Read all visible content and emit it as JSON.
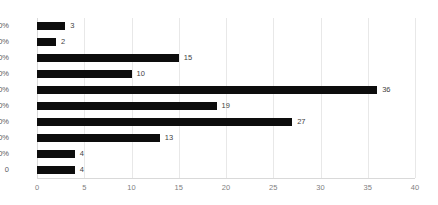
{
  "chart_data": {
    "type": "bar",
    "orientation": "horizontal",
    "title": "",
    "xlabel": "",
    "ylabel": "",
    "categories": [
      "90%",
      "80%",
      "70%",
      "60%",
      "50%",
      "40%",
      "30%",
      "20%",
      "10%",
      "0"
    ],
    "values": [
      3,
      2,
      15,
      10,
      36,
      19,
      27,
      13,
      4,
      4
    ],
    "data_labels": [
      "3",
      "2",
      "15",
      "10",
      "36",
      "19",
      "27",
      "13",
      "4",
      "4"
    ],
    "xlim": [
      0,
      40
    ],
    "xticks": [
      0,
      5,
      10,
      15,
      20,
      25,
      30,
      35,
      40
    ],
    "xtick_labels": [
      "0",
      "5",
      "10",
      "15",
      "20",
      "25",
      "30",
      "35",
      "40"
    ],
    "grid": "vertical",
    "legend": "none",
    "colors": {
      "bar": "#0d0d0d",
      "gridline": "#e8e8e8",
      "axis": "#d9d9d9",
      "category_label": "#5a5a5a",
      "tick_label": "#808080",
      "data_label": "#3f3f3f",
      "background": "#ffffff"
    }
  }
}
